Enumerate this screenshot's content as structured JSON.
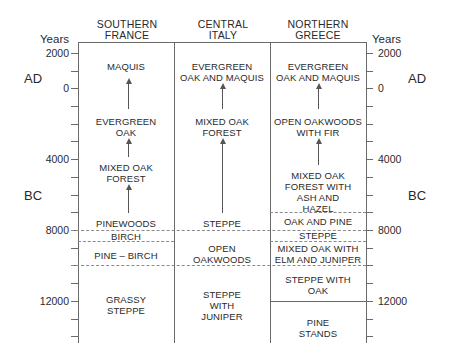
{
  "columns": [
    {
      "name": "SOUTHERN\nFRANCE",
      "line1": "SOUTHERN",
      "line2": "FRANCE"
    },
    {
      "name": "CENTRAL\nITALY",
      "line1": "CENTRAL",
      "line2": "ITALY"
    },
    {
      "name": "NORTHERN\nGREECE",
      "line1": "NORTHERN",
      "line2": "GREECE"
    }
  ],
  "axis": {
    "unit_label": "Years",
    "era_ad": "AD",
    "era_bc": "BC",
    "ticks": [
      "2000",
      "0",
      "4000",
      "8000",
      "12000"
    ]
  },
  "southern_france": {
    "maquis": "MAQUIS",
    "evergreen_oak_1": "EVERGREEN",
    "evergreen_oak_2": "OAK",
    "mixed_oak_1": "MIXED OAK",
    "mixed_oak_2": "FOREST",
    "pinewoods": "PINEWOODS",
    "birch": "BIRCH",
    "pine_birch": "PINE – BIRCH",
    "grassy_1": "GRASSY",
    "grassy_2": "STEPPE"
  },
  "central_italy": {
    "evergreen_1": "EVERGREEN",
    "evergreen_2": "OAK AND MAQUIS",
    "mixed_oak_1": "MIXED OAK",
    "mixed_oak_2": "FOREST",
    "steppe": "STEPPE",
    "open_oak_1": "OPEN",
    "open_oak_2": "OAKWOODS",
    "steppe_juniper_1": "STEPPE",
    "steppe_juniper_2": "WITH",
    "steppe_juniper_3": "JUNIPER"
  },
  "northern_greece": {
    "evergreen_1": "EVERGREEN",
    "evergreen_2": "OAK AND MAQUIS",
    "open_oak_fir_1": "OPEN OAKWOODS",
    "open_oak_fir_2": "WITH FIR",
    "mixed_ash_1": "MIXED OAK",
    "mixed_ash_2": "FOREST WITH",
    "mixed_ash_3": "ASH AND",
    "mixed_ash_4": "HAZEL",
    "oak_pine": "OAK AND PINE",
    "steppe": "STEPPE",
    "mixed_elm_1": "MIXED OAK WITH",
    "mixed_elm_2": "ELM AND JUNIPER",
    "steppe_oak_1": "STEPPE WITH",
    "steppe_oak_2": "OAK",
    "pine_stands_1": "PINE",
    "pine_stands_2": "STANDS"
  }
}
